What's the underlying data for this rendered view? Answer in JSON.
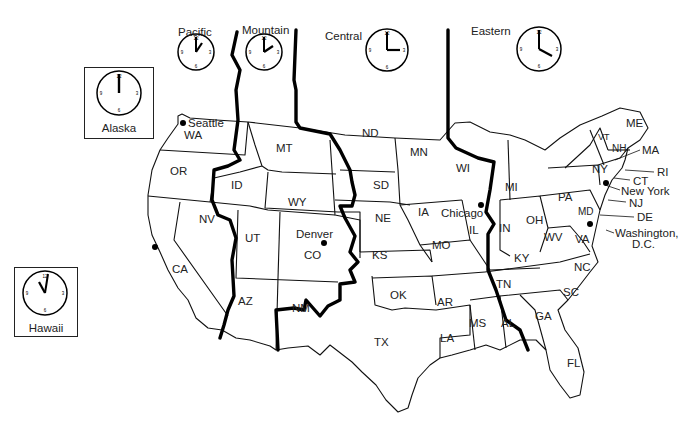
{
  "zones": [
    {
      "name": "Pacific",
      "hour": 1,
      "minute": 0
    },
    {
      "name": "Mountain",
      "hour": 2,
      "minute": 0
    },
    {
      "name": "Central",
      "hour": 3,
      "minute": 0
    },
    {
      "name": "Eastern",
      "hour": 4,
      "minute": 0
    },
    {
      "name": "Alaska",
      "hour": 12,
      "minute": 0
    },
    {
      "name": "Hawaii",
      "hour": 11,
      "minute": 0
    }
  ],
  "zone_labels": {
    "pacific": "Pacific",
    "mountain": "Mountain",
    "central": "Central",
    "eastern": "Eastern",
    "alaska": "Alaska",
    "hawaii": "Hawaii"
  },
  "clock_numbers": [
    "12",
    "1",
    "2",
    "3",
    "4",
    "5",
    "6",
    "7",
    "8",
    "9",
    "10",
    "11"
  ],
  "states": {
    "WA": "WA",
    "OR": "OR",
    "CA": "CA",
    "NV": "NV",
    "ID": "ID",
    "MT": "MT",
    "WY": "WY",
    "UT": "UT",
    "CO": "CO",
    "AZ": "AZ",
    "NM": "NM",
    "ND": "ND",
    "SD": "SD",
    "NE": "NE",
    "KS": "KS",
    "OK": "OK",
    "TX": "TX",
    "MN": "MN",
    "IA": "IA",
    "MO": "MO",
    "AR": "AR",
    "LA": "LA",
    "WI": "WI",
    "IL": "IL",
    "MS": "MS",
    "AL": "AL",
    "TN": "TN",
    "KY": "KY",
    "IN": "IN",
    "MI": "MI",
    "OH": "OH",
    "GA": "GA",
    "FL": "FL",
    "SC": "SC",
    "NC": "NC",
    "VA": "VA",
    "WV": "WV",
    "PA": "PA",
    "NY": "NY",
    "VT": "VT",
    "NH": "NH",
    "ME": "ME",
    "MA": "MA",
    "RI": "RI",
    "CT": "CT",
    "NJ": "NJ",
    "DE": "DE",
    "MD": "MD"
  },
  "cities": {
    "seattle": "Seattle",
    "denver": "Denver",
    "chicago": "Chicago",
    "new_york": "New York",
    "washington_1": "Washington,",
    "washington_2": "D.C."
  },
  "colors": {
    "ink": "#000000",
    "background": "#ffffff"
  }
}
